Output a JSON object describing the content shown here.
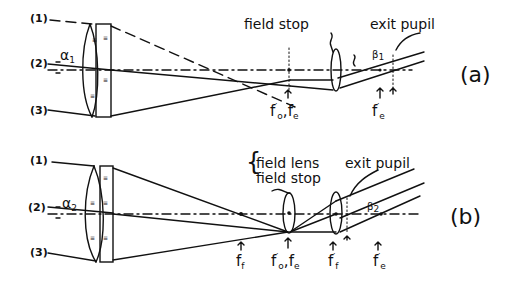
{
  "diagram": {
    "panel_a": {
      "tag": "(a)",
      "ray_labels": [
        "(1)",
        "(2)",
        "(3)"
      ],
      "angle_label": "α",
      "angle_sub": "1",
      "out_angle_label": "β",
      "out_angle_sub": "1",
      "field_stop_label": "field stop",
      "exit_pupil_label": "exit pupil",
      "focus_labels": [
        {
          "main": "f",
          "sup": "′",
          "sub": "o",
          "sep": ",",
          "main2": "f",
          "sub2": "e"
        },
        {
          "main": "f",
          "sup": "′",
          "sub": "e"
        }
      ]
    },
    "panel_b": {
      "tag": "(b)",
      "ray_labels": [
        "(1)",
        "(2)",
        "(3)"
      ],
      "angle_label": "α",
      "angle_sub": "2",
      "out_angle_label": "β",
      "out_angle_sub": "2",
      "field_lens_label": "field lens",
      "field_stop_label": "field stop",
      "exit_pupil_label": "exit pupil",
      "focus_labels": [
        {
          "main": "f",
          "sub": "f"
        },
        {
          "main": "f",
          "sup": "′",
          "sub": "o",
          "sep": ",",
          "main2": "f",
          "sub2": "e"
        },
        {
          "main": "f",
          "sup": "′",
          "sub": "f"
        },
        {
          "main": "f",
          "sup": "′",
          "sub": "e"
        }
      ]
    }
  }
}
